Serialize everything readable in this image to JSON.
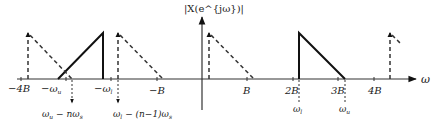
{
  "diagram": {
    "y_axis_label": "|X(e^{jω})|",
    "x_axis_label": "ω",
    "tick_labels": [
      {
        "id": "m4B",
        "text": "−4B",
        "value": -4
      },
      {
        "id": "mwu",
        "text": "−ω",
        "sub": "u",
        "value": -3.2
      },
      {
        "id": "mwl",
        "text": "−ω",
        "sub": "l",
        "value": -2.2
      },
      {
        "id": "mB",
        "text": "−B",
        "value": -1
      },
      {
        "id": "B",
        "text": "B",
        "value": 1
      },
      {
        "id": "2B",
        "text": "2B",
        "value": 2
      },
      {
        "id": "3B",
        "text": "3B",
        "value": 3
      },
      {
        "id": "4B",
        "text": "4B",
        "value": 4
      }
    ],
    "below_labels": [
      {
        "id": "wl",
        "text": "ω",
        "sub": "l"
      },
      {
        "id": "wu",
        "text": "ω",
        "sub": "u"
      }
    ],
    "alias_labels": [
      {
        "id": "alias1",
        "text": "ω",
        "sub": "u",
        "rest": " − nω",
        "sub2": "s"
      },
      {
        "id": "alias2",
        "text": "ω",
        "sub": "l",
        "rest": " − (n−1)ω",
        "sub2": "s"
      }
    ],
    "colors": {
      "line": "#111111",
      "axis": "#333333",
      "dashed": "#333333"
    }
  }
}
